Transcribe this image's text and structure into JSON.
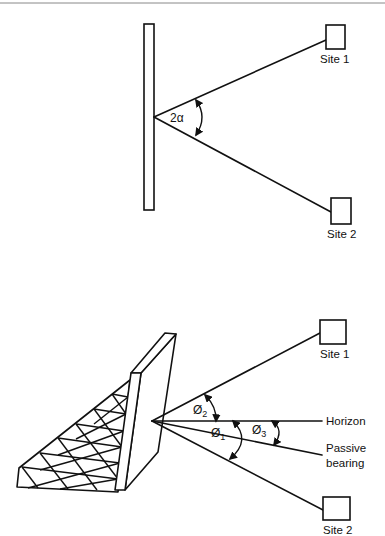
{
  "page": {
    "header_rule": true
  },
  "top_diagram": {
    "description": "Single reflector: angle between two site paths",
    "angle_label": "2α",
    "sites": [
      {
        "label": "Site 1"
      },
      {
        "label": "Site 2"
      }
    ]
  },
  "bottom_diagram": {
    "description": "Passive reflector with lattice support; angles relative to horizon",
    "angles": [
      {
        "symbol": "Ø",
        "subscript": "2"
      },
      {
        "symbol": "Ø",
        "subscript": "1"
      },
      {
        "symbol": "Ø",
        "subscript": "3"
      }
    ],
    "labels": {
      "horizon": "Horizon",
      "passive_line1": "Passive",
      "passive_line2": "bearing"
    },
    "sites": [
      {
        "label": "Site 1"
      },
      {
        "label": "Site 2"
      }
    ]
  }
}
